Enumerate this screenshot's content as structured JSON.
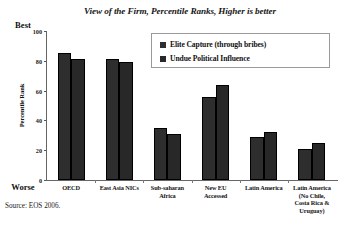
{
  "figure": {
    "title": "View of the Firm, Percentile Ranks, Higher is better",
    "source_note": "Source: EOS 2006.",
    "best_label": "Best",
    "worse_label": "Worse",
    "legend_position": "top-right-inside",
    "bar_color": "#2b2b2b",
    "frame_color": "#666666"
  },
  "chart_data": {
    "type": "bar",
    "title": "View of the Firm, Percentile Ranks, Higher is better",
    "xlabel": "",
    "ylabel": "Percentile Rank",
    "ylim": [
      0,
      100
    ],
    "yticks": [
      0,
      20,
      40,
      60,
      80,
      100
    ],
    "grid": false,
    "categories": [
      "OECD",
      "East Asia NICs",
      "Sub-saharan Africa",
      "New EU Accessed",
      "Latin America",
      "Latin America (No Chile, Costa Rica & Uruguay)"
    ],
    "category_lines": [
      [
        "OECD"
      ],
      [
        "East Asia NICs"
      ],
      [
        "Sub-saharan",
        "Africa"
      ],
      [
        "New EU",
        "Accessed"
      ],
      [
        "Latin America"
      ],
      [
        "Latin America",
        "(No Chile,",
        "Costa Rica &",
        "Uruguay)"
      ]
    ],
    "series": [
      {
        "name": "Elite Capture (through bribes)",
        "color": "#2e2e2e",
        "values": [
          85,
          81,
          35,
          56,
          29,
          21
        ]
      },
      {
        "name": "Undue Political Influence",
        "color": "#282828",
        "values": [
          81,
          79,
          31,
          64,
          32,
          25
        ]
      }
    ]
  }
}
